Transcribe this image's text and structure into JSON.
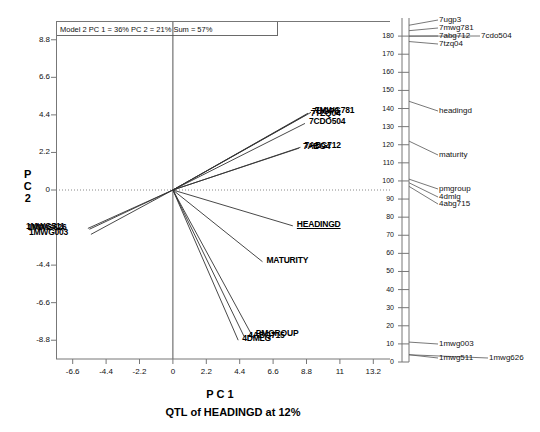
{
  "chart_data": {
    "type": "scatter",
    "title": "Model 2 PC 1 = 36% PC 2 = 21% Sum = 57%",
    "caption": "QTL of HEADINGD at 12%",
    "xlabel": "P C 1",
    "ylabel": "P C 2",
    "xlim": [
      -7.7,
      14.3
    ],
    "ylim": [
      -9.9,
      9.9
    ],
    "xticks": [
      "-6.6",
      "-4.4",
      "-2.2",
      "0",
      "2.2",
      "4.4",
      "6.6",
      "8.8",
      "11",
      "13.2"
    ],
    "xtickvals": [
      -6.6,
      -4.4,
      -2.2,
      0,
      2.2,
      4.4,
      6.6,
      8.8,
      11,
      13.2
    ],
    "yticks": [
      "8.8",
      "6.6",
      "4.4",
      "2.2",
      "0",
      "-2.2",
      "-4.4",
      "-6.6",
      "-8.8"
    ],
    "ytickvals": [
      8.8,
      6.6,
      4.4,
      2.2,
      0,
      -2.2,
      -4.4,
      -6.6,
      -8.8
    ],
    "grid": false,
    "legend": "none",
    "origin": [
      0,
      0
    ],
    "vectors": [
      {
        "label": "7MWG781",
        "x": 9.1,
        "y": 4.55,
        "label_dx": 4,
        "label_dy": -4
      },
      {
        "label": "7UGP3",
        "x": 8.9,
        "y": 4.5,
        "label_dx": 4,
        "label_dy": -4
      },
      {
        "label": "7TZQ04",
        "x": 8.8,
        "y": 4.42,
        "label_dx": 4,
        "label_dy": -4
      },
      {
        "label": "7CDO504",
        "x": 8.7,
        "y": 3.9,
        "label_dx": 4,
        "label_dy": -4
      },
      {
        "label": "7ABG712",
        "x": 8.4,
        "y": 2.5,
        "label_dx": 4,
        "label_dy": -4
      },
      {
        "label": "7ABG4",
        "x": 8.3,
        "y": 2.45,
        "label_dx": 4,
        "label_dy": -4
      },
      {
        "label": "HEADINGD",
        "x": 7.9,
        "y": -2.1,
        "label_dx": 4,
        "label_dy": -4,
        "underline": true
      },
      {
        "label": "MATURITY",
        "x": 5.9,
        "y": -4.2,
        "label_dx": 4,
        "label_dy": -4
      },
      {
        "label": "PMGROUP",
        "x": 5.2,
        "y": -8.5,
        "label_dx": 4,
        "label_dy": -4
      },
      {
        "label": "4ABG715",
        "x": 4.7,
        "y": -8.6,
        "label_dx": 4,
        "label_dy": -4
      },
      {
        "label": "4DMLG",
        "x": 4.3,
        "y": -8.8,
        "label_dx": 4,
        "label_dy": -4
      },
      {
        "label": "1MWG511",
        "x": -5.6,
        "y": -2.25,
        "label_dx": -4,
        "label_dy": -4
      },
      {
        "label": "1MWG626",
        "x": -5.5,
        "y": -2.3,
        "label_dx": -4,
        "label_dy": -4
      },
      {
        "label": "1MWG003",
        "x": -5.4,
        "y": -2.6,
        "label_dx": -4,
        "label_dy": -4
      }
    ],
    "right_axis": {
      "min": 0,
      "max": 190,
      "step": 10,
      "ticks": [
        "180",
        "170",
        "160",
        "150",
        "140",
        "130",
        "120",
        "110",
        "100",
        "90",
        "80",
        "70",
        "60",
        "50",
        "40",
        "30",
        "20",
        "10",
        "0"
      ],
      "tickvals": [
        180,
        170,
        160,
        150,
        140,
        130,
        120,
        110,
        100,
        90,
        80,
        70,
        60,
        50,
        40,
        30,
        20,
        10,
        0
      ],
      "markers": [
        {
          "label": "7ugp3",
          "value": 186,
          "lx": 46,
          "ly": 2
        },
        {
          "label": "7mwg781",
          "value": 183,
          "lx": 46,
          "ly": 10
        },
        {
          "label": "7abg712",
          "value": 180,
          "lx": 46,
          "ly": 18
        },
        {
          "label": "7cdo504",
          "value": 180,
          "lx": 88,
          "ly": 18
        },
        {
          "label": "7tzq04",
          "value": 177,
          "lx": 46,
          "ly": 26
        },
        {
          "label": "headingd",
          "value": 144,
          "lx": 46,
          "ly": 93
        },
        {
          "label": "maturity",
          "value": 122,
          "lx": 46,
          "ly": 137
        },
        {
          "label": "pmgroup",
          "value": 101,
          "lx": 46,
          "ly": 171
        },
        {
          "label": "4dmlg",
          "value": 99,
          "lx": 46,
          "ly": 179
        },
        {
          "label": "4abg715",
          "value": 97,
          "lx": 46,
          "ly": 186
        },
        {
          "label": "1mwg003",
          "value": 11,
          "lx": 46,
          "ly": 326
        },
        {
          "label": "1mwg511",
          "value": 4,
          "lx": 46,
          "ly": 340
        },
        {
          "label": "1mwg626",
          "value": 4,
          "lx": 96,
          "ly": 340
        }
      ]
    }
  }
}
